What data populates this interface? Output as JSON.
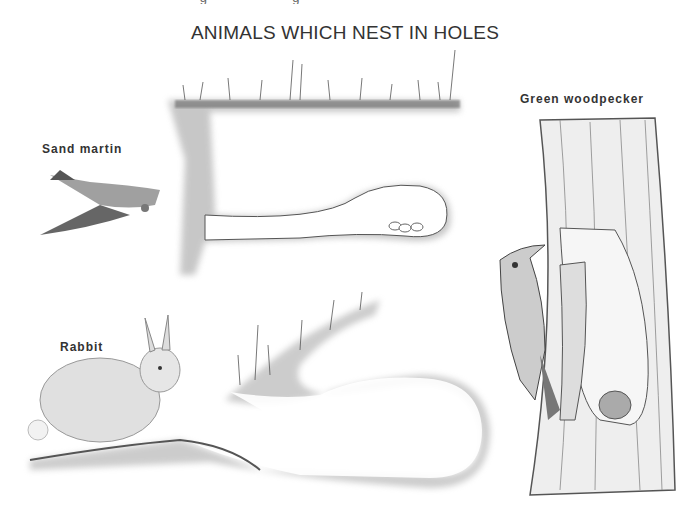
{
  "page": {
    "top_cutoff_text": "· · · g · · · · · · · · g ·",
    "title": "ANIMALS WHICH NEST IN HOLES"
  },
  "labels": {
    "sand_martin": "Sand martin",
    "rabbit": "Rabbit",
    "green_woodpecker": "Green woodpecker"
  },
  "colors": {
    "ink": "#333333",
    "soil": "#8a8a8a",
    "soil_light": "#c8c8c8",
    "background": "#ffffff"
  }
}
